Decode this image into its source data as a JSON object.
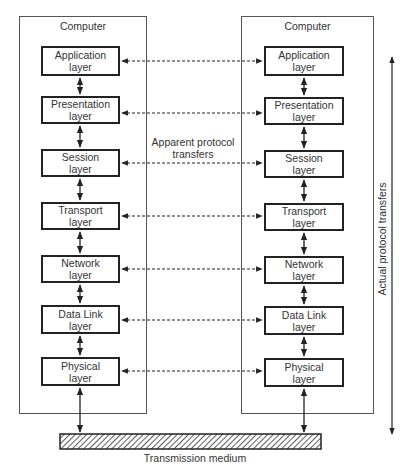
{
  "diagram": {
    "type": "OSI reference model - peer protocol layers",
    "computers": [
      {
        "title": "Computer",
        "side": "left",
        "layers": [
          {
            "name": "Application",
            "sub": "layer"
          },
          {
            "name": "Presentation",
            "sub": "layer"
          },
          {
            "name": "Session",
            "sub": "layer"
          },
          {
            "name": "Transport",
            "sub": "layer"
          },
          {
            "name": "Network",
            "sub": "layer"
          },
          {
            "name": "Data Link",
            "sub": "layer"
          },
          {
            "name": "Physical",
            "sub": "layer"
          }
        ]
      },
      {
        "title": "Computer",
        "side": "right",
        "layers": [
          {
            "name": "Application",
            "sub": "layer"
          },
          {
            "name": "Presentation",
            "sub": "layer"
          },
          {
            "name": "Session",
            "sub": "layer"
          },
          {
            "name": "Transport",
            "sub": "layer"
          },
          {
            "name": "Network",
            "sub": "layer"
          },
          {
            "name": "Data Link",
            "sub": "layer"
          },
          {
            "name": "Physical",
            "sub": "layer"
          }
        ]
      }
    ],
    "apparent_label_line1": "Apparent protocol",
    "apparent_label_line2": "transfers",
    "actual_label": "Actual protocol transfers",
    "medium_label": "Transmission medium",
    "colors": {
      "line": "#222222",
      "box_border": "#555555",
      "text": "#333333"
    }
  }
}
